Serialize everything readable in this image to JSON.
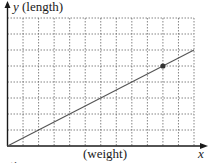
{
  "chart_data": {
    "type": "line",
    "title": "",
    "xlabel": "(weight)",
    "ylabel": "(length)",
    "x_axis_variable": "x",
    "y_axis_variable": "y",
    "x_axis_label_full": "x (weight)",
    "y_axis_label_full": "y (length)",
    "grid": true,
    "grid_style": "dotted",
    "grid_columns": 12,
    "grid_rows": 8,
    "xlim": [
      0,
      12
    ],
    "ylim": [
      0,
      8
    ],
    "tick_labels_x": [],
    "tick_labels_y": [],
    "series": [
      {
        "name": "line",
        "x": [
          0,
          12
        ],
        "y": [
          0,
          6
        ],
        "slope": 0.5,
        "color": "#555555"
      }
    ],
    "highlighted_points": [
      {
        "x": 10,
        "y": 5,
        "color": "#333333"
      }
    ],
    "legend": null
  },
  "labels": {
    "y_var": "y",
    "y_text": " (length)",
    "x_text": "(weight)",
    "x_var": "x",
    "clipped_caption": "ration"
  },
  "colors": {
    "axis": "#1a1a1a",
    "grid": "#666666",
    "line": "#555555",
    "point": "#333333",
    "background": "#ffffff"
  }
}
